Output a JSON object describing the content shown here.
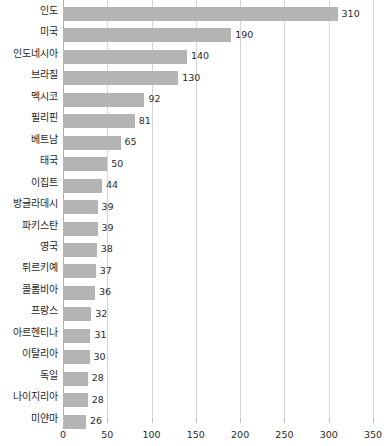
{
  "chart_data": {
    "type": "bar",
    "orientation": "horizontal",
    "title": "",
    "xlabel": "",
    "ylabel": "",
    "xlim": [
      0,
      350
    ],
    "xticks": [
      0,
      50,
      100,
      150,
      200,
      250,
      300,
      350
    ],
    "grid": true,
    "legend": false,
    "bar_color": "#b4b4b4",
    "gridline_color": "#d5d5d5",
    "axis_color": "#b0b0b0",
    "categories": [
      "인도",
      "미국",
      "인도네시아",
      "브라질",
      "멕시코",
      "필리핀",
      "베트남",
      "태국",
      "이집트",
      "방글라데시",
      "파키스탄",
      "영국",
      "튀르키예",
      "콜롬비아",
      "프랑스",
      "아르헨티나",
      "이탈리아",
      "독일",
      "나이지리아",
      "미얀마"
    ],
    "values": [
      310,
      190,
      140,
      130,
      92,
      81,
      65,
      50,
      44,
      39,
      39,
      38,
      37,
      36,
      32,
      31,
      30,
      28,
      28,
      26
    ],
    "value_labels": [
      "310",
      "190",
      "140",
      "130",
      "92",
      "81",
      "65",
      "50",
      "44",
      "39",
      "39",
      "38",
      "37",
      "36",
      "32",
      "31",
      "30",
      "28",
      "28",
      "26"
    ],
    "xtick_labels": [
      "0",
      "50",
      "100",
      "150",
      "200",
      "250",
      "300",
      "350"
    ]
  }
}
